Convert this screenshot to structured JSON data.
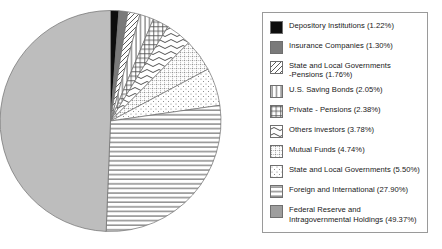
{
  "chart_data": {
    "type": "pie",
    "title": "",
    "subtitle": "",
    "xlabel": "",
    "ylabel": "",
    "grid": false,
    "legend_position": "right",
    "start_angle_deg": 0,
    "direction": "clockwise",
    "units": "percent",
    "categories": [
      "Depository Institutions",
      "Insurance Companies",
      "State and Local Governments -Pensions",
      "U.S. Saving Bonds",
      "Private - Pensions",
      "Others investors",
      "Mutual Funds",
      "State and Local Governments",
      "Foreign and International",
      "Federal Reserve and Intragovernmental Holdings"
    ],
    "values": [
      1.22,
      1.3,
      1.76,
      2.05,
      2.38,
      3.78,
      4.74,
      5.5,
      27.9,
      49.37
    ],
    "slices": [
      {
        "label": "Depository Institutions",
        "value": 1.22,
        "pattern": "solid-black",
        "color": "#0d0d0d"
      },
      {
        "label": "Insurance Companies",
        "value": 1.3,
        "pattern": "solid-gray",
        "color": "#7a7a7a"
      },
      {
        "label": "State and Local Governments -Pensions",
        "value": 1.76,
        "pattern": "diagonal-hatch",
        "color": "#ffffff"
      },
      {
        "label": "U.S. Saving Bonds",
        "value": 2.05,
        "pattern": "vertical-lines",
        "color": "#ffffff"
      },
      {
        "label": "Private - Pensions",
        "value": 2.38,
        "pattern": "crosshatch-grid",
        "color": "#ffffff"
      },
      {
        "label": "Others investors",
        "value": 3.78,
        "pattern": "wavy-lines",
        "color": "#ffffff"
      },
      {
        "label": "Mutual Funds",
        "value": 4.74,
        "pattern": "dotted-grid",
        "color": "#ffffff"
      },
      {
        "label": "State and Local Governments",
        "value": 5.5,
        "pattern": "sparse-dots",
        "color": "#ffffff"
      },
      {
        "label": "Foreign and International",
        "value": 27.9,
        "pattern": "horizontal-lines",
        "color": "#ffffff"
      },
      {
        "label": "Federal Reserve and Intragovernmental Holdings",
        "value": 49.37,
        "pattern": "solid-light-gray",
        "color": "#bdbdbd"
      }
    ]
  },
  "legend": {
    "items": [
      {
        "text": "Depository Institutions (1.22%)",
        "swatch": "solid-black-swatch"
      },
      {
        "text": "Insurance Companies (1.30%)",
        "swatch": "solid-gray-swatch"
      },
      {
        "text": "State and Local Governments\n-Pensions (1.76%)",
        "swatch": "diagonal-hatch-swatch"
      },
      {
        "text": "U.S. Saving Bonds (2.05%)",
        "swatch": "vertical-lines-swatch"
      },
      {
        "text": "Private - Pensions (2.38%)",
        "swatch": "crosshatch-grid-swatch"
      },
      {
        "text": "Others investors (3.78%)",
        "swatch": "wavy-lines-swatch"
      },
      {
        "text": "Mutual Funds (4.74%)",
        "swatch": "dotted-grid-swatch"
      },
      {
        "text": "State and Local Governments (5.50%)",
        "swatch": "sparse-dots-swatch"
      },
      {
        "text": "Foreign and International (27.90%)",
        "swatch": "horizontal-lines-swatch"
      },
      {
        "text": "Federal Reserve and\nIntragovernmental Holdings (49.37%)",
        "swatch": "solid-light-gray-swatch"
      }
    ]
  },
  "colors": {
    "black": "#0d0d0d",
    "mid_gray": "#7a7a7a",
    "light_gray": "#bdbdbd",
    "outline": "#6f6f6f",
    "legend_border": "#9a9a9a",
    "background": "#ffffff"
  }
}
